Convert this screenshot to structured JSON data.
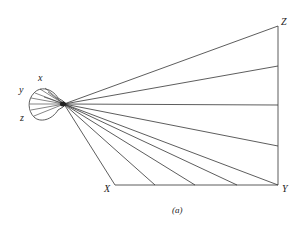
{
  "diagram": {
    "caption": "(a)",
    "labels": {
      "x_eye": "x",
      "y_eye": "y",
      "z_eye": "z",
      "X": "X",
      "Y": "Y",
      "Z": "Z"
    },
    "colors": {
      "stroke": "#333333",
      "background": "#ffffff"
    }
  }
}
